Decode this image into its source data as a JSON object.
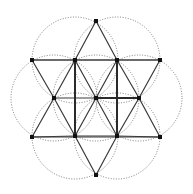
{
  "diagram": {
    "title": "",
    "background": "#ffffff",
    "colors": {
      "circle": "#6e6e6e",
      "edge": "#3a3a3a",
      "node": "#111111"
    },
    "center": {
      "x": 96,
      "y": 98
    },
    "radius": 43,
    "nodes": [
      {
        "id": "c",
        "x": 96,
        "y": 98
      },
      {
        "id": "h1",
        "x": 75,
        "y": 60
      },
      {
        "id": "h2",
        "x": 117,
        "y": 60
      },
      {
        "id": "h3",
        "x": 139,
        "y": 98
      },
      {
        "id": "h4",
        "x": 117,
        "y": 136
      },
      {
        "id": "h5",
        "x": 75,
        "y": 136
      },
      {
        "id": "h6",
        "x": 54,
        "y": 98
      },
      {
        "id": "t1",
        "x": 96,
        "y": 21
      },
      {
        "id": "t2",
        "x": 160,
        "y": 60
      },
      {
        "id": "t3",
        "x": 160,
        "y": 137
      },
      {
        "id": "t4",
        "x": 96,
        "y": 175
      },
      {
        "id": "t5",
        "x": 32,
        "y": 137
      },
      {
        "id": "t6",
        "x": 32,
        "y": 60
      }
    ],
    "circles": [
      {
        "cx": 96,
        "cy": 98,
        "r": 43
      },
      {
        "cx": 75,
        "cy": 60,
        "r": 43
      },
      {
        "cx": 117,
        "cy": 60,
        "r": 43
      },
      {
        "cx": 139,
        "cy": 98,
        "r": 43
      },
      {
        "cx": 117,
        "cy": 136,
        "r": 43
      },
      {
        "cx": 75,
        "cy": 136,
        "r": 43
      },
      {
        "cx": 54,
        "cy": 98,
        "r": 43
      }
    ],
    "edges": [
      [
        "t1",
        "h1"
      ],
      [
        "t1",
        "h2"
      ],
      [
        "t6",
        "h1"
      ],
      [
        "h1",
        "h2"
      ],
      [
        "h2",
        "t2"
      ],
      [
        "t6",
        "h6"
      ],
      [
        "t2",
        "h3"
      ],
      [
        "h6",
        "h5"
      ],
      [
        "h3",
        "h4"
      ],
      [
        "t5",
        "h5"
      ],
      [
        "h5",
        "h4"
      ],
      [
        "h4",
        "t3"
      ],
      [
        "t5",
        "h6"
      ],
      [
        "t3",
        "h3"
      ],
      [
        "h5",
        "t4"
      ],
      [
        "h4",
        "t4"
      ],
      [
        "h1",
        "c"
      ],
      [
        "h2",
        "c"
      ],
      [
        "h3",
        "c"
      ],
      [
        "h4",
        "c"
      ],
      [
        "h5",
        "c"
      ],
      [
        "h6",
        "c"
      ],
      [
        "h1",
        "h6"
      ],
      [
        "h2",
        "h3"
      ],
      [
        "t6",
        "t2"
      ],
      [
        "t5",
        "t3"
      ]
    ],
    "bold_edges": [
      [
        "c",
        "h3"
      ],
      [
        "h1",
        "h5"
      ],
      [
        "h2",
        "h4"
      ]
    ]
  }
}
